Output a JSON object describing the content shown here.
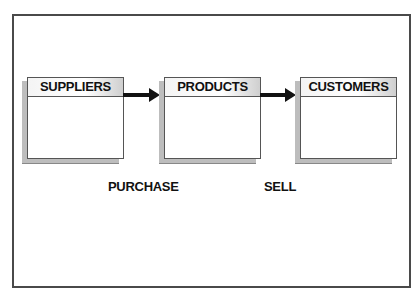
{
  "diagram": {
    "boxes": [
      {
        "label": "SUPPLIERS"
      },
      {
        "label": "PRODUCTS"
      },
      {
        "label": "CUSTOMERS"
      }
    ],
    "arrows": [
      {
        "from": "SUPPLIERS",
        "to": "PRODUCTS",
        "label": "PURCHASE"
      },
      {
        "from": "PRODUCTS",
        "to": "CUSTOMERS",
        "label": "SELL"
      }
    ]
  }
}
